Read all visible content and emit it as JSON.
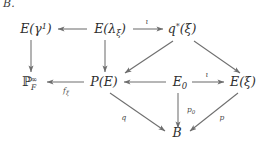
{
  "caption": {
    "label": "B."
  },
  "diagram": {
    "type": "commutative-diagram",
    "nodes": [
      {
        "id": "E_gamma1",
        "label": "E(γ¹)",
        "base": "E(",
        "sym": "γ",
        "sup": "1",
        "close": ")",
        "x": 36,
        "y": 33
      },
      {
        "id": "E_lambda_xi",
        "label": "E(λ_ξ)",
        "base": "E(",
        "sym": "λ",
        "sub": "ξ",
        "close": ")",
        "x": 110,
        "y": 33
      },
      {
        "id": "q_star_xi",
        "label": "q*(ξ)",
        "base": "q",
        "sup": "*",
        "close": "(ξ)",
        "x": 182,
        "y": 33
      },
      {
        "id": "P_F_infty",
        "label": "ℙ_F^∞",
        "base": "ℙ",
        "sub": "F",
        "sup": "∞",
        "x": 30,
        "y": 85
      },
      {
        "id": "P_E",
        "label": "P(E)",
        "base": "P(E)",
        "x": 104,
        "y": 85
      },
      {
        "id": "E_0",
        "label": "E₀",
        "base": "E",
        "sub": "0",
        "x": 180,
        "y": 85
      },
      {
        "id": "E_xi",
        "label": "E(ξ)",
        "base": "E(ξ)",
        "x": 243,
        "y": 85
      },
      {
        "id": "B",
        "label": "B",
        "base": "B",
        "x": 177,
        "y": 136
      }
    ],
    "edges": [
      {
        "id": "e1",
        "from": "E_lambda_xi",
        "to": "E_gamma1",
        "label": "",
        "direction": "left"
      },
      {
        "id": "e2",
        "from": "E_lambda_xi",
        "to": "q_star_xi",
        "label": "ι",
        "direction": "right"
      },
      {
        "id": "e3",
        "from": "E_gamma1",
        "to": "P_F_infty",
        "label": "",
        "direction": "down"
      },
      {
        "id": "e4",
        "from": "E_lambda_xi",
        "to": "P_E",
        "label": "",
        "direction": "down"
      },
      {
        "id": "e5",
        "from": "q_star_xi",
        "to": "P_E",
        "label": "",
        "direction": "down-left"
      },
      {
        "id": "e6",
        "from": "q_star_xi",
        "to": "E_xi",
        "label": "",
        "direction": "down-right"
      },
      {
        "id": "e7",
        "from": "P_E",
        "to": "P_F_infty",
        "label": "fξ",
        "direction": "left"
      },
      {
        "id": "e8",
        "from": "E_0",
        "to": "P_E",
        "label": "",
        "direction": "left"
      },
      {
        "id": "e9",
        "from": "E_0",
        "to": "E_xi",
        "label": "ι",
        "direction": "right"
      },
      {
        "id": "e10",
        "from": "P_E",
        "to": "B",
        "label": "q",
        "direction": "down-right"
      },
      {
        "id": "e11",
        "from": "E_0",
        "to": "B",
        "label": "p₀",
        "direction": "down"
      },
      {
        "id": "e12",
        "from": "E_xi",
        "to": "B",
        "label": "p",
        "direction": "down-left"
      }
    ],
    "labels": {
      "iota_top": "ι",
      "iota_mid": "ι",
      "f_xi_base": "f",
      "f_xi_sub": "ξ",
      "q": "q",
      "p0_base": "p",
      "p0_sub": "0",
      "p": "p"
    },
    "colors": {
      "background": "#ffffff",
      "text": "#2e2e2e",
      "arrow": "#6e6e6e",
      "label": "#4a4a4a"
    }
  }
}
